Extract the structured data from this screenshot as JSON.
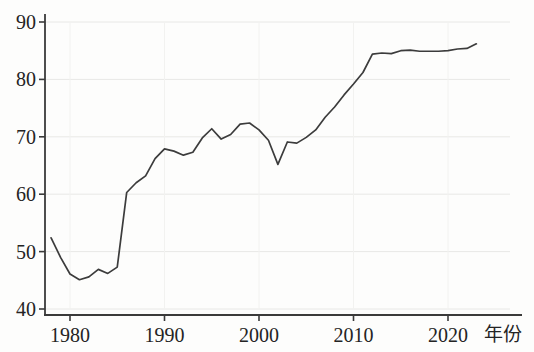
{
  "chart_data": {
    "type": "line",
    "title": "",
    "subtitle": "",
    "xlabel": "年份",
    "ylabel": "",
    "xlim": [
      1977.5,
      2024.5
    ],
    "ylim": [
      38.5,
      91.5
    ],
    "grid": true,
    "grid_axis": "y",
    "legend": "none",
    "line_color": "#3c3c3c",
    "grid_color": "#e8e8e6",
    "axis_color": "#3a3a3a",
    "background_color": "#fdfdfc",
    "xticks": [
      1980,
      1990,
      2000,
      2010,
      2020
    ],
    "xtick_labels": [
      "1980",
      "1990",
      "2000",
      "2010",
      "2020"
    ],
    "yticks": [
      40,
      50,
      60,
      70,
      80,
      90
    ],
    "ytick_labels": [
      "40",
      "50",
      "60",
      "70",
      "80",
      "90"
    ],
    "series": [
      {
        "name": "",
        "x": [
          1978,
          1979,
          1980,
          1981,
          1982,
          1983,
          1984,
          1985,
          1986,
          1987,
          1988,
          1989,
          1990,
          1991,
          1992,
          1993,
          1994,
          1995,
          1996,
          1997,
          1998,
          1999,
          2000,
          2001,
          2002,
          2003,
          2004,
          2005,
          2006,
          2007,
          2008,
          2009,
          2010,
          2011,
          2012,
          2013,
          2014,
          2015,
          2016,
          2017,
          2018,
          2019,
          2020,
          2021,
          2022,
          2023
        ],
        "values": [
          52.4,
          49.0,
          46.1,
          45.1,
          45.6,
          46.9,
          46.2,
          47.3,
          60.3,
          62.0,
          63.2,
          66.2,
          67.9,
          67.5,
          66.8,
          67.3,
          69.8,
          71.4,
          69.6,
          70.4,
          72.2,
          72.4,
          71.2,
          69.4,
          65.2,
          69.1,
          68.9,
          69.9,
          71.2,
          73.4,
          75.2,
          77.3,
          79.2,
          81.2,
          84.4,
          84.6,
          84.5,
          85.0,
          85.1,
          84.9,
          84.9,
          84.9,
          85.0,
          85.3,
          85.4,
          86.2
        ]
      }
    ]
  }
}
